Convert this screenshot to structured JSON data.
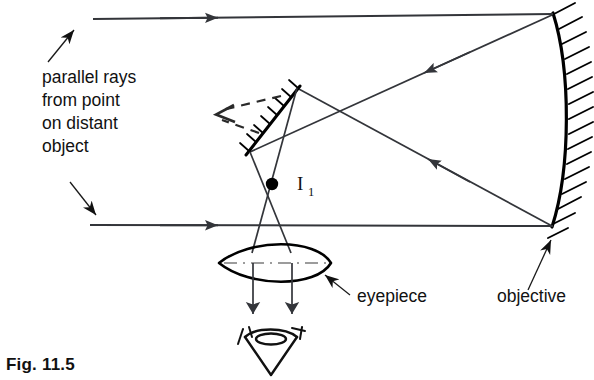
{
  "figure": {
    "caption": "Fig. 11.5"
  },
  "annotations": {
    "source_label_lines": [
      "parallel rays",
      "from point",
      "on distant",
      "object"
    ],
    "eyepiece_label": "eyepiece",
    "objective_label": "objective",
    "image_label": "I",
    "image_label_subscript": "1"
  },
  "colors": {
    "ink": "#111111",
    "ray": "#33353a",
    "background": "#ffffff"
  },
  "optics": {
    "objective_type": "concave-mirror",
    "secondary_type": "plane-mirror",
    "eyepiece_type": "converging-lens",
    "incoming_ray_count": 2,
    "detector": "eye"
  }
}
